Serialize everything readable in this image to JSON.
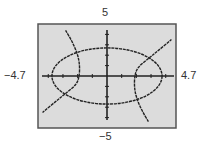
{
  "chart_data": {
    "type": "line",
    "title": "",
    "xlabel": "",
    "ylabel": "",
    "xlim": [
      -4.7,
      4.7
    ],
    "ylim": [
      -5,
      5
    ],
    "grid": false,
    "axis_labels": {
      "xmin": "−4.7",
      "xmax": "4.7",
      "ymax": "5",
      "ymin": "−5"
    },
    "x_tick_step": 1,
    "y_tick_step": 1,
    "series": [
      {
        "name": "ellipse",
        "kind": "ellipse",
        "center": [
          0,
          0
        ],
        "a": 3.75,
        "b": 2.7
      },
      {
        "name": "hyperbola-left-branch",
        "kind": "polyline",
        "points": [
          [
            -2.82,
            4.38
          ],
          [
            -2.41,
            3.41
          ],
          [
            -2.07,
            2.36
          ],
          [
            -1.87,
            1.3
          ],
          [
            -1.87,
            0.05
          ],
          [
            -2.07,
            -0.82
          ],
          [
            -2.82,
            -1.68
          ],
          [
            -3.5,
            -2.45
          ],
          [
            -4.39,
            -3.51
          ]
        ]
      },
      {
        "name": "hyperbola-right-branch",
        "kind": "polyline",
        "points": [
          [
            2.82,
            -4.38
          ],
          [
            2.41,
            -3.41
          ],
          [
            2.07,
            -2.36
          ],
          [
            1.87,
            -1.3
          ],
          [
            1.87,
            -0.05
          ],
          [
            2.07,
            0.82
          ],
          [
            2.82,
            1.68
          ],
          [
            3.5,
            2.45
          ],
          [
            4.39,
            3.51
          ]
        ]
      }
    ],
    "colors": {
      "plot_background": "#dcdcdc",
      "frame": "#555555",
      "curve": "#222222",
      "axis": "#222222"
    }
  }
}
